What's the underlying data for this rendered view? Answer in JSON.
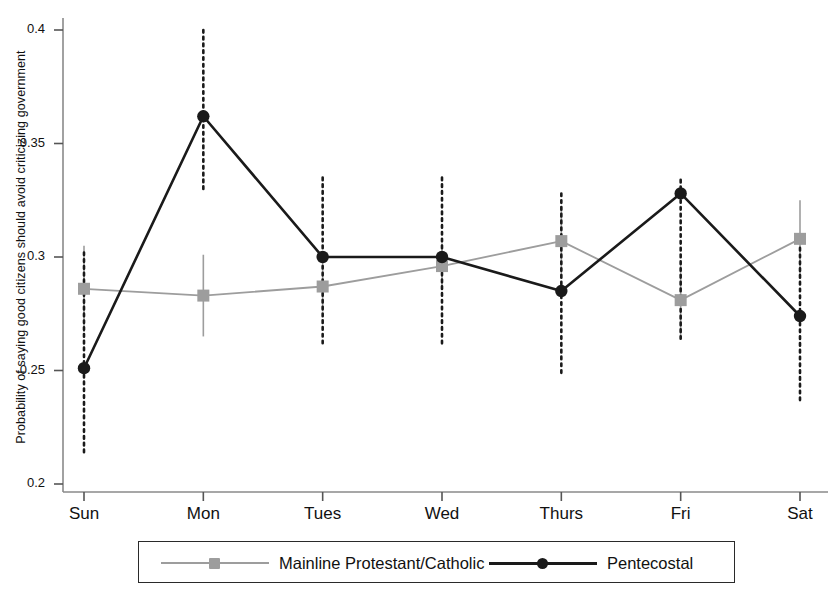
{
  "chart_data": {
    "type": "line",
    "title": "",
    "xlabel": "",
    "ylabel": "Probability of saying good citizens should avoid criticizing government",
    "categories": [
      "Sun",
      "Mon",
      "Tues",
      "Wed",
      "Thurs",
      "Fri",
      "Sat"
    ],
    "ylim": [
      0.2,
      0.4
    ],
    "ytick_labels": [
      "0.2",
      "0.25",
      "0.3",
      "0.35",
      "0.4"
    ],
    "ytick_values": [
      0.2,
      0.25,
      0.3,
      0.35,
      0.4
    ],
    "grid": false,
    "legend_position": "bottom",
    "series": [
      {
        "name": "Mainline Protestant/Catholic",
        "color": "#9d9d9d",
        "marker": "square",
        "line_style": "solid",
        "error_style": "solid",
        "values": [
          0.286,
          0.283,
          0.287,
          0.296,
          0.307,
          0.281,
          0.308
        ],
        "error_low": [
          0.267,
          0.265,
          0.276,
          0.286,
          0.292,
          0.264,
          0.291
        ],
        "error_high": [
          0.305,
          0.301,
          0.298,
          0.306,
          0.322,
          0.298,
          0.325
        ]
      },
      {
        "name": "Pentecostal",
        "color": "#1a1a1a",
        "marker": "circle",
        "line_style": "solid",
        "error_style": "dotted",
        "values": [
          0.251,
          0.362,
          0.3,
          0.3,
          0.285,
          0.328,
          0.274
        ],
        "error_low": [
          0.213,
          0.33,
          0.262,
          0.261,
          0.248,
          0.263,
          0.236
        ],
        "error_high": [
          0.302,
          0.4,
          0.335,
          0.335,
          0.328,
          0.334,
          0.304
        ]
      }
    ]
  },
  "axis": {
    "y_label": "Probability of saying good citizens should avoid criticizing government"
  },
  "legend": {
    "entries": [
      {
        "label": "Mainline Protestant/Catholic"
      },
      {
        "label": "Pentecostal"
      }
    ]
  }
}
